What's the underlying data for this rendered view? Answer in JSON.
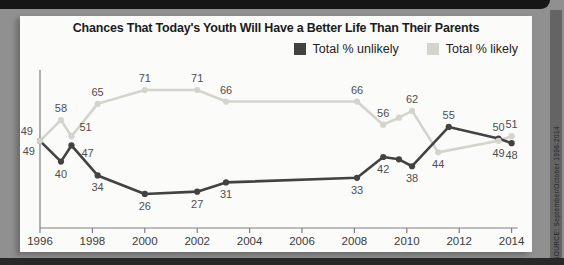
{
  "frame": {
    "source_note": "SOURCE: September/October 1996-2014"
  },
  "chart_data": {
    "type": "line",
    "title": "Chances That Today's Youth Will Have a Better Life Than Their Parents",
    "xlabel": "",
    "ylabel": "",
    "grid": false,
    "legend_position": "top-right",
    "x_axis": {
      "range": [
        1996,
        2014
      ],
      "ticks": [
        1996,
        1998,
        2000,
        2002,
        2004,
        2006,
        2008,
        2010,
        2012,
        2014
      ]
    },
    "y_axis": {
      "range": [
        20,
        75
      ],
      "ticks_shown": false
    },
    "series": [
      {
        "name": "Total % unlikely",
        "color": "#424242",
        "points": [
          {
            "x": 1996,
            "y": 49,
            "label": "49",
            "lp": "lb"
          },
          {
            "x": 1996.8,
            "y": 40,
            "label": "40",
            "lp": "b"
          },
          {
            "x": 1997.2,
            "y": 47,
            "label": "47",
            "lp": "rb"
          },
          {
            "x": 1998.2,
            "y": 34,
            "label": "34",
            "lp": "b"
          },
          {
            "x": 2000,
            "y": 26,
            "label": "26",
            "lp": "b"
          },
          {
            "x": 2002,
            "y": 27,
            "label": "27",
            "lp": "b"
          },
          {
            "x": 2003.1,
            "y": 31,
            "label": "31",
            "lp": "b"
          },
          {
            "x": 2008.1,
            "y": 33,
            "label": "33",
            "lp": "b"
          },
          {
            "x": 2009.1,
            "y": 42,
            "label": "42",
            "lp": "b"
          },
          {
            "x": 2009.7,
            "y": 41,
            "label": "",
            "lp": ""
          },
          {
            "x": 2010.2,
            "y": 38,
            "label": "38",
            "lp": "b"
          },
          {
            "x": 2011.6,
            "y": 55,
            "label": "55",
            "lp": "a"
          },
          {
            "x": 2013.5,
            "y": 50,
            "label": "50",
            "lp": "a"
          },
          {
            "x": 2014,
            "y": 48,
            "label": "48",
            "lp": "b"
          }
        ]
      },
      {
        "name": "Total % likely",
        "color": "#d3d5cc",
        "points": [
          {
            "x": 1996,
            "y": 49,
            "label": "49",
            "lp": "la"
          },
          {
            "x": 1996.8,
            "y": 58,
            "label": "58",
            "lp": "a"
          },
          {
            "x": 1997.2,
            "y": 51,
            "label": "51",
            "lp": "ra"
          },
          {
            "x": 1998.2,
            "y": 65,
            "label": "65",
            "lp": "a"
          },
          {
            "x": 2000,
            "y": 71,
            "label": "71",
            "lp": "a"
          },
          {
            "x": 2002,
            "y": 71,
            "label": "71",
            "lp": "a"
          },
          {
            "x": 2003.1,
            "y": 66,
            "label": "66",
            "lp": "a"
          },
          {
            "x": 2008.1,
            "y": 66,
            "label": "66",
            "lp": "a"
          },
          {
            "x": 2009.1,
            "y": 56,
            "label": "56",
            "lp": "a"
          },
          {
            "x": 2009.7,
            "y": 59,
            "label": "",
            "lp": ""
          },
          {
            "x": 2010.2,
            "y": 62,
            "label": "62",
            "lp": "a"
          },
          {
            "x": 2011.2,
            "y": 44,
            "label": "44",
            "lp": "b"
          },
          {
            "x": 2013.5,
            "y": 49,
            "label": "49",
            "lp": "b"
          },
          {
            "x": 2014,
            "y": 51,
            "label": "51",
            "lp": "a"
          }
        ]
      }
    ],
    "style": {
      "axis_color": "#7e7e7e",
      "tick_label_color": "#3a3a3a",
      "point_label_color": "#4f4f4f"
    }
  }
}
